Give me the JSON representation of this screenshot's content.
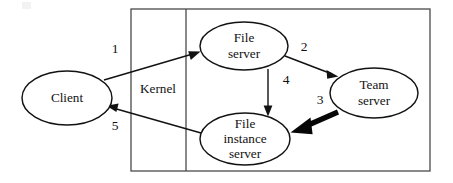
{
  "figure": {
    "background_color": "#ffffff",
    "stroke_color": "#121212"
  },
  "regions": [
    {
      "id": "kernel",
      "label": "Kernel",
      "label_x": 158,
      "label_y": 90,
      "box": {
        "x": 131,
        "y": 9,
        "width": 299,
        "height": 162
      },
      "divider_x": 186
    }
  ],
  "nodes": [
    {
      "id": "client",
      "label": "Client",
      "lines": [
        "Client"
      ],
      "cx": 67,
      "cy": 98,
      "rx": 45,
      "ry": 27
    },
    {
      "id": "file-server",
      "label": "File server",
      "lines": [
        "File",
        "server"
      ],
      "cx": 244,
      "cy": 46,
      "rx": 44,
      "ry": 24
    },
    {
      "id": "team-server",
      "label": "Team server",
      "lines": [
        "Team",
        "server"
      ],
      "cx": 374,
      "cy": 93,
      "rx": 44,
      "ry": 25
    },
    {
      "id": "file-instance-server",
      "label": "File instance server",
      "lines": [
        "File",
        "instance",
        "server"
      ],
      "cx": 245,
      "cy": 139,
      "rx": 45,
      "ry": 26
    }
  ],
  "edges": [
    {
      "id": "edge-1",
      "label": "1",
      "from": "client",
      "to": "file-server",
      "style": "thin",
      "label_x": 115,
      "label_y": 50,
      "x1": 104,
      "y1": 80,
      "x2": 199,
      "y2": 52
    },
    {
      "id": "edge-2",
      "label": "2",
      "from": "file-server",
      "to": "team-server",
      "style": "thin",
      "label_x": 304,
      "label_y": 48,
      "x1": 285,
      "y1": 56,
      "x2": 337,
      "y2": 76
    },
    {
      "id": "edge-3",
      "label": "3",
      "from": "team-server",
      "to": "file-instance-server",
      "style": "thick",
      "label_x": 320,
      "label_y": 101,
      "x1": 336,
      "y1": 113,
      "x2": 292,
      "y2": 131
    },
    {
      "id": "edge-4",
      "label": "4",
      "from": "file-server",
      "to": "file-instance-server",
      "style": "thin",
      "label_x": 286,
      "label_y": 81,
      "x1": 268,
      "y1": 69,
      "x2": 268,
      "y2": 115
    },
    {
      "id": "edge-5",
      "label": "5",
      "from": "file-instance-server",
      "to": "client",
      "style": "thin",
      "label_x": 115,
      "label_y": 127,
      "x1": 201,
      "y1": 133,
      "x2": 107,
      "y2": 106
    }
  ]
}
